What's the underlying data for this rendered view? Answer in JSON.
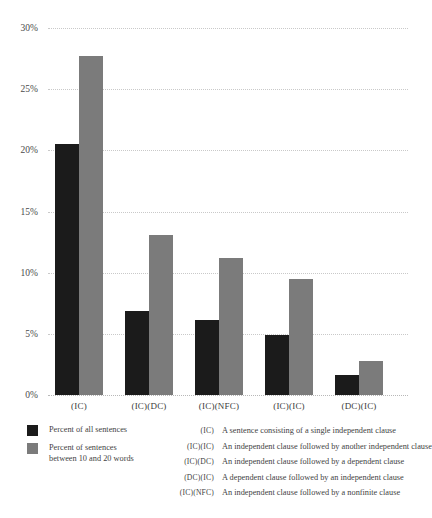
{
  "chart_data": {
    "type": "bar",
    "title": "",
    "xlabel": "",
    "ylabel": "",
    "ylim": [
      0,
      30
    ],
    "ytick_labels": [
      "30%",
      "25%",
      "20%",
      "15%",
      "10%",
      "5%",
      "0%"
    ],
    "ytick_values": [
      30,
      25,
      20,
      15,
      10,
      5,
      0
    ],
    "grid": true,
    "legend_position": "bottom-left",
    "categories": [
      "(IC)",
      "(IC)(DC)",
      "(IC)(NFC)",
      "(IC)(IC)",
      "(DC)(IC)"
    ],
    "series": [
      {
        "name": "Percent of all sentences",
        "color": "#1b1b1b",
        "values": [
          20.5,
          6.9,
          6.1,
          4.9,
          1.6
        ]
      },
      {
        "name": "Percent of sentences between 10 and 20 words",
        "color": "#7b7b7b",
        "values": [
          27.7,
          13.1,
          11.2,
          9.5,
          2.8
        ]
      }
    ]
  },
  "legend": {
    "items": [
      {
        "swatch": "dark",
        "line1": "Percent of all sentences",
        "line2": ""
      },
      {
        "swatch": "light",
        "line1": "Percent of sentences",
        "line2": "between 10 and 20 words"
      }
    ]
  },
  "definitions": [
    {
      "code": "(IC)",
      "text": "A sentence consisting of a single independent clause"
    },
    {
      "code": "(IC)(IC)",
      "text": "An independent clause followed by another independent clause"
    },
    {
      "code": "(IC)(DC)",
      "text": "An independent clause followed by a dependent clause"
    },
    {
      "code": "(DC)(IC)",
      "text": "A dependent clause followed by an independent clause"
    },
    {
      "code": "(IC)(NFC)",
      "text": "An independent clause followed by a nonfinite clause"
    }
  ],
  "colors": {
    "dark_bar": "#1b1b1b",
    "light_bar": "#7b7b7b",
    "gridline": "#c9c9c9",
    "background": "#ffffff",
    "text": "#3f3f3f"
  }
}
